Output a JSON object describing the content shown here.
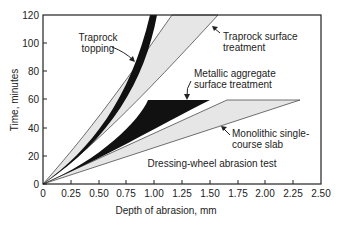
{
  "chart_data": {
    "type": "area",
    "title": "",
    "annotation": "Dressing-wheel abrasion test",
    "xlabel": "Depth of abrasion, mm",
    "ylabel": "Time, minutes",
    "xlim": [
      0,
      2.5
    ],
    "ylim": [
      0,
      120
    ],
    "xticks": [
      "0",
      "0.25",
      "0.50",
      "0.75",
      "1.00",
      "1.25",
      "1.50",
      "1.75",
      "2.00",
      "2.25",
      "2.50"
    ],
    "yticks": [
      "0",
      "20",
      "40",
      "60",
      "80",
      "100",
      "120"
    ],
    "grid": false,
    "legend": "none (bands labeled directly with arrows)",
    "series": [
      {
        "name": "Traprock topping",
        "fill": "#111111",
        "lower_bound": {
          "depth": [
            0,
            0.25,
            0.5,
            0.75,
            0.9,
            1.02
          ],
          "time": [
            0,
            14,
            32,
            60,
            88,
            120
          ]
        },
        "upper_bound": {
          "depth": [
            0,
            0.2,
            0.4,
            0.6,
            0.8,
            0.96
          ],
          "time": [
            0,
            14,
            32,
            58,
            90,
            120
          ]
        }
      },
      {
        "name": "Traprock surface treatment",
        "fill": "#e6e6e6",
        "lower_bound": {
          "depth": [
            0,
            0.5,
            1.0,
            1.3,
            1.58
          ],
          "time": [
            0,
            24,
            60,
            90,
            120
          ]
        },
        "upper_bound": {
          "depth": [
            0,
            0.45,
            0.8,
            1.0,
            1.16
          ],
          "time": [
            0,
            24,
            60,
            90,
            120
          ]
        }
      },
      {
        "name": "Metallic aggregate surface treatment",
        "fill": "#111111",
        "lower_bound": {
          "depth": [
            0,
            0.5,
            1.0,
            1.5
          ],
          "time": [
            0,
            22,
            44,
            60
          ]
        },
        "upper_bound": {
          "depth": [
            0,
            0.5,
            0.8,
            0.95
          ],
          "time": [
            0,
            28,
            50,
            60
          ]
        }
      },
      {
        "name": "Monolithic single-course slab",
        "fill": "#e6e6e6",
        "lower_bound": {
          "depth": [
            0,
            1.0,
            2.33
          ],
          "time": [
            0,
            26,
            60
          ]
        },
        "upper_bound": {
          "depth": [
            0,
            1.0,
            1.65
          ],
          "time": [
            0,
            37,
            60
          ]
        }
      }
    ]
  }
}
